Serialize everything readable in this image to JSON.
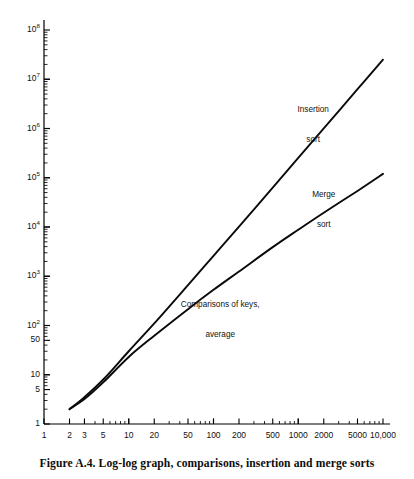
{
  "figure": {
    "caption": "Figure A.4.  Log-log graph, comparisons, insertion and merge sorts",
    "accent_color": "#000000",
    "background_color": "#ffffff"
  },
  "chart_data": {
    "type": "line",
    "title": "Log-log graph, comparisons, insertion and merge sorts",
    "xlabel": "",
    "ylabel": "",
    "xscale": "log",
    "yscale": "log",
    "xlim": [
      1,
      10000
    ],
    "ylim": [
      1,
      100000000
    ],
    "grid": false,
    "legend": "inline-annotations",
    "x_ticks": [
      "1",
      "2",
      "3",
      "5",
      "10",
      "20",
      "50",
      "100",
      "200",
      "500",
      "1000",
      "2000",
      "5000",
      "10,000"
    ],
    "x_tick_values": [
      1,
      2,
      3,
      5,
      10,
      20,
      50,
      100,
      200,
      500,
      1000,
      2000,
      5000,
      10000
    ],
    "y_ticks": [
      "1",
      "5",
      "10",
      "50",
      "10^2",
      "10^3",
      "10^4",
      "10^5",
      "10^6",
      "10^7",
      "10^8"
    ],
    "y_tick_values": [
      1,
      5,
      10,
      50,
      100,
      1000,
      10000,
      100000,
      1000000,
      10000000,
      100000000
    ],
    "annotations": [
      {
        "name": "insertion-sort-label",
        "text": "Insertion\nsort",
        "x": 1500,
        "y": 1200000
      },
      {
        "name": "merge-sort-label",
        "text": "Merge\nsort",
        "x": 2000,
        "y": 22000
      },
      {
        "name": "axis-note",
        "text": "Comparisons of keys,\naverage",
        "x": 120,
        "y": 130
      }
    ],
    "series": [
      {
        "name": "Insertion sort",
        "label": "Insertion\nsort",
        "x": [
          2,
          3,
          5,
          10,
          20,
          50,
          100,
          200,
          500,
          1000,
          2000,
          5000,
          10000
        ],
        "y": [
          2,
          3.5,
          8,
          30,
          110,
          660,
          2600,
          10200,
          63000,
          252000,
          1005000,
          6270000,
          25000000
        ]
      },
      {
        "name": "Merge sort",
        "label": "Merge\nsort",
        "x": [
          2,
          3,
          5,
          10,
          20,
          50,
          100,
          200,
          500,
          1000,
          2000,
          5000,
          10000
        ],
        "y": [
          2,
          3.2,
          7,
          23,
          62,
          215,
          530,
          1250,
          3900,
          8800,
          19500,
          54000,
          120000
        ]
      }
    ]
  },
  "y_axis": {
    "labels": [
      {
        "text": "10",
        "sup": "8",
        "value": 100000000
      },
      {
        "text": "10",
        "sup": "7",
        "value": 10000000
      },
      {
        "text": "10",
        "sup": "6",
        "value": 1000000
      },
      {
        "text": "10",
        "sup": "5",
        "value": 100000
      },
      {
        "text": "10",
        "sup": "4",
        "value": 10000
      },
      {
        "text": "10",
        "sup": "3",
        "value": 1000
      },
      {
        "text": "10",
        "sup": "2",
        "value": 100
      },
      {
        "text": "50",
        "sup": "",
        "value": 50
      },
      {
        "text": "10",
        "sup": "",
        "value": 10
      },
      {
        "text": "5",
        "sup": "",
        "value": 5
      },
      {
        "text": "1",
        "sup": "",
        "value": 1
      }
    ]
  },
  "x_axis": {
    "labels": [
      {
        "text": "1",
        "value": 1
      },
      {
        "text": "2",
        "value": 2
      },
      {
        "text": "3",
        "value": 3
      },
      {
        "text": "5",
        "value": 5
      },
      {
        "text": "10",
        "value": 10
      },
      {
        "text": "20",
        "value": 20
      },
      {
        "text": "50",
        "value": 50
      },
      {
        "text": "100",
        "value": 100
      },
      {
        "text": "200",
        "value": 200
      },
      {
        "text": "500",
        "value": 500
      },
      {
        "text": "1000",
        "value": 1000
      },
      {
        "text": "2000",
        "value": 2000
      },
      {
        "text": "5000",
        "value": 5000
      },
      {
        "text": "10,000",
        "value": 10000
      }
    ]
  },
  "annotations": {
    "insertion": {
      "line1": "Insertion",
      "line2": "sort"
    },
    "merge": {
      "line1": "Merge",
      "line2": "sort"
    },
    "note": {
      "line1": "Comparisons of keys,",
      "line2": "average"
    }
  }
}
